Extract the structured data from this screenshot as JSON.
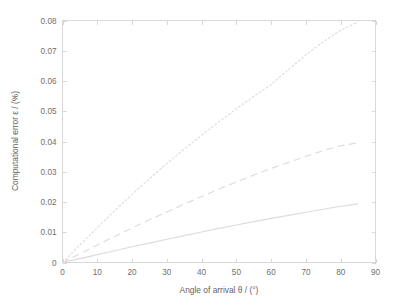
{
  "chart_data": {
    "type": "line",
    "title": "",
    "xlabel": "Angle of arrival   θ / (°)",
    "ylabel": "Computational error   ε / (%)",
    "xlim": [
      0,
      90
    ],
    "ylim": [
      0,
      0.08
    ],
    "xticks": [
      0,
      10,
      20,
      30,
      40,
      50,
      60,
      70,
      80,
      90
    ],
    "xtick_labels": [
      "0",
      "10",
      "20",
      "30",
      "40",
      "50",
      "60",
      "70",
      "80",
      "90"
    ],
    "yticks": [
      0,
      0.01,
      0.02,
      0.03,
      0.04,
      0.05,
      0.06,
      0.07,
      0.08
    ],
    "ytick_labels": [
      "0",
      "0.01",
      "0.02",
      "0.03",
      "0.04",
      "0.05",
      "0.06",
      "0.07",
      "0.08"
    ],
    "grid": false,
    "legend": "none",
    "line_color": "#dcdcdc",
    "frame_color": "#d8d8d8",
    "x": [
      0,
      5,
      10,
      15,
      20,
      25,
      30,
      35,
      40,
      45,
      50,
      55,
      60,
      65,
      70,
      75,
      80,
      85
    ],
    "series": [
      {
        "name": "upper",
        "style": "dotted",
        "values": [
          0.0,
          0.0058,
          0.0115,
          0.0171,
          0.0225,
          0.0277,
          0.0327,
          0.0375,
          0.0421,
          0.0465,
          0.0508,
          0.0549,
          0.0588,
          0.0638,
          0.0687,
          0.073,
          0.0768,
          0.0795
        ]
      },
      {
        "name": "middle",
        "style": "dashed",
        "values": [
          0.0,
          0.0029,
          0.0058,
          0.0086,
          0.0114,
          0.0141,
          0.0167,
          0.0193,
          0.0218,
          0.0243,
          0.0266,
          0.0289,
          0.0311,
          0.0331,
          0.0351,
          0.037,
          0.0386,
          0.0396
        ]
      },
      {
        "name": "lower",
        "style": "solid",
        "values": [
          0.0,
          0.0013,
          0.0026,
          0.0039,
          0.0052,
          0.0064,
          0.0077,
          0.0089,
          0.0101,
          0.0113,
          0.0124,
          0.0135,
          0.0146,
          0.0156,
          0.0166,
          0.0176,
          0.0186,
          0.0194
        ]
      }
    ]
  }
}
